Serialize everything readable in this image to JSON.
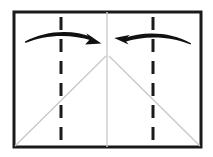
{
  "figure": {
    "kind": "origami-fold-step",
    "canvas": {
      "width": 213,
      "height": 157,
      "background": "#ffffff"
    },
    "colors": {
      "sheet_outline": "#1a1a1a",
      "crease_dashed": "#1a1a1a",
      "crease_light": "#c8c8c8",
      "center_line": "#cccccc",
      "arrow": "#111111",
      "paper_fill": "#ffffff"
    },
    "sheet": {
      "name": "paper-sheet",
      "x": 14,
      "y": 12,
      "width": 187,
      "height": 135,
      "stroke_width": 3
    },
    "center_fold_line": {
      "name": "center-vertical-fold",
      "x": 107,
      "y1": 12,
      "y2": 147,
      "style": "solid",
      "color": "#cccccc",
      "width": 1.4
    },
    "dashed_creases": [
      {
        "name": "left-dashed-crease",
        "x": 61,
        "y1": 17,
        "y2": 145,
        "style": "dashed",
        "color": "#1a1a1a",
        "width": 3,
        "dash": "13 9"
      },
      {
        "name": "right-dashed-crease",
        "x": 153,
        "y1": 17,
        "y2": 145,
        "style": "dashed",
        "color": "#1a1a1a",
        "width": 3,
        "dash": "13 9"
      }
    ],
    "diagonal_creases": [
      {
        "name": "left-diagonal-crease",
        "x1": 15,
        "y1": 146,
        "x2": 106,
        "y2": 56,
        "style": "solid",
        "color": "#c8c8c8",
        "width": 1.3
      },
      {
        "name": "right-diagonal-crease",
        "x1": 109,
        "y1": 56,
        "x2": 200,
        "y2": 146,
        "style": "solid",
        "color": "#c8c8c8",
        "width": 1.3
      }
    ],
    "arrows": [
      {
        "name": "left-fold-arrow",
        "direction": "right",
        "label": "fold left edge toward center",
        "tail_x": 25,
        "tail_y": 41,
        "head_x": 101,
        "head_y": 44,
        "arc_peak_y": 32,
        "color": "#111111"
      },
      {
        "name": "right-fold-arrow",
        "direction": "left",
        "label": "fold right edge toward center",
        "tail_x": 191,
        "tail_y": 43,
        "head_x": 114,
        "head_y": 40,
        "arc_peak_y": 32,
        "color": "#111111"
      }
    ]
  }
}
